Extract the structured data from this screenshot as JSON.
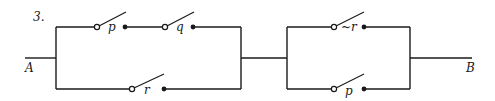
{
  "problem": {
    "number": "3."
  },
  "terminals": {
    "left": "A",
    "right": "B"
  },
  "switches": {
    "p_top": {
      "label": "p"
    },
    "q_top": {
      "label": "q"
    },
    "r_bottom": {
      "label": "r"
    },
    "not_r": {
      "label": "~r"
    },
    "p_bottom": {
      "label": "p"
    }
  },
  "colors": {
    "ink": "#1a1a1a",
    "background": "#ffffff"
  }
}
